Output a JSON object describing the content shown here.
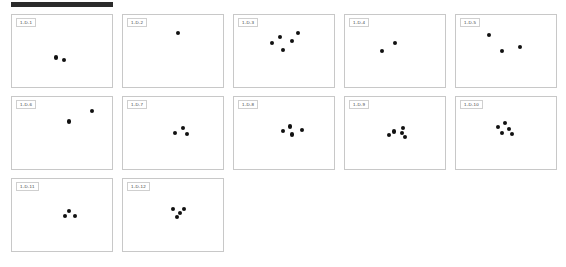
{
  "document": {
    "title": "1-D stimulus panel sheet",
    "header_rule_color": "#2b2b2b",
    "panel_border_color": "#c8c8c8",
    "dot_color": "#111111",
    "columns": 5,
    "panel_count": 12
  },
  "panels": [
    {
      "id": "panel-1",
      "label": "1-D-1",
      "dot_count": 2,
      "dots": [
        {
          "x": 44,
          "y": 59
        },
        {
          "x": 52,
          "y": 62
        }
      ]
    },
    {
      "id": "panel-2",
      "label": "1-D-2",
      "dot_count": 1,
      "dots": [
        {
          "x": 55,
          "y": 25
        }
      ]
    },
    {
      "id": "panel-3",
      "label": "1-D-3",
      "dot_count": 5,
      "dots": [
        {
          "x": 46,
          "y": 30
        },
        {
          "x": 64,
          "y": 25
        },
        {
          "x": 58,
          "y": 36
        },
        {
          "x": 38,
          "y": 39
        },
        {
          "x": 49,
          "y": 49
        }
      ]
    },
    {
      "id": "panel-4",
      "label": "1-D-4",
      "dot_count": 2,
      "dots": [
        {
          "x": 50,
          "y": 39
        },
        {
          "x": 37,
          "y": 50
        }
      ]
    },
    {
      "id": "panel-5",
      "label": "1-D-5",
      "dot_count": 3,
      "dots": [
        {
          "x": 33,
          "y": 28
        },
        {
          "x": 46,
          "y": 50
        },
        {
          "x": 64,
          "y": 44
        }
      ]
    },
    {
      "id": "panel-6",
      "label": "1-D-6",
      "dot_count": 2,
      "dots": [
        {
          "x": 80,
          "y": 19
        },
        {
          "x": 57,
          "y": 34
        }
      ]
    },
    {
      "id": "panel-7",
      "label": "1-D-7",
      "dot_count": 3,
      "dots": [
        {
          "x": 60,
          "y": 43
        },
        {
          "x": 52,
          "y": 50
        },
        {
          "x": 64,
          "y": 51
        }
      ]
    },
    {
      "id": "panel-8",
      "label": "1-D-8",
      "dot_count": 4,
      "dots": [
        {
          "x": 56,
          "y": 41
        },
        {
          "x": 49,
          "y": 47
        },
        {
          "x": 68,
          "y": 46
        },
        {
          "x": 58,
          "y": 52
        }
      ]
    },
    {
      "id": "panel-9",
      "label": "1-D-9",
      "dot_count": 5,
      "dots": [
        {
          "x": 58,
          "y": 43
        },
        {
          "x": 49,
          "y": 48
        },
        {
          "x": 57,
          "y": 50
        },
        {
          "x": 44,
          "y": 53
        },
        {
          "x": 60,
          "y": 55
        }
      ]
    },
    {
      "id": "panel-10",
      "label": "1-D-10",
      "dot_count": 5,
      "dots": [
        {
          "x": 49,
          "y": 36
        },
        {
          "x": 42,
          "y": 42
        },
        {
          "x": 53,
          "y": 44
        },
        {
          "x": 46,
          "y": 50
        },
        {
          "x": 56,
          "y": 51
        }
      ]
    },
    {
      "id": "panel-11",
      "label": "1-D-11",
      "dot_count": 3,
      "dots": [
        {
          "x": 57,
          "y": 44
        },
        {
          "x": 53,
          "y": 51
        },
        {
          "x": 63,
          "y": 51
        }
      ]
    },
    {
      "id": "panel-12",
      "label": "1-D-12",
      "dot_count": 4,
      "dots": [
        {
          "x": 50,
          "y": 42
        },
        {
          "x": 61,
          "y": 42
        },
        {
          "x": 57,
          "y": 47
        },
        {
          "x": 54,
          "y": 53
        }
      ]
    }
  ]
}
